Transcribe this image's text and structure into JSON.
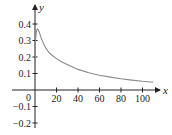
{
  "chart_data": {
    "type": "line",
    "title": "",
    "xlabel": "x",
    "ylabel": "y",
    "xlim": [
      -5,
      112
    ],
    "ylim": [
      -0.25,
      0.45
    ],
    "grid": false,
    "legend": null,
    "x_ticks": [
      20,
      40,
      60,
      80,
      100
    ],
    "x_tick_labels": [
      "20",
      "40",
      "60",
      "80",
      "100"
    ],
    "y_ticks": [
      0.4,
      0.3,
      0.2,
      0.1,
      -0.1,
      -0.2
    ],
    "y_tick_labels": [
      "0.4",
      "0.3",
      "0.2",
      "0.1",
      "−0.1",
      "−0.2"
    ],
    "origin_label": "0",
    "series": [
      {
        "name": "curve",
        "color": "#888888",
        "x": [
          0.5,
          1,
          1.5,
          2,
          2.5,
          3,
          4,
          5,
          6,
          8,
          10,
          12,
          15,
          20,
          25,
          30,
          40,
          50,
          60,
          70,
          80,
          90,
          100,
          110
        ],
        "y": [
          0.3,
          0.34,
          0.36,
          0.37,
          0.37,
          0.365,
          0.35,
          0.33,
          0.31,
          0.28,
          0.255,
          0.235,
          0.215,
          0.19,
          0.17,
          0.155,
          0.125,
          0.105,
          0.09,
          0.078,
          0.068,
          0.06,
          0.053,
          0.047
        ]
      }
    ]
  },
  "colors": {
    "axis": "#222222",
    "curve": "#8a8a8a"
  }
}
